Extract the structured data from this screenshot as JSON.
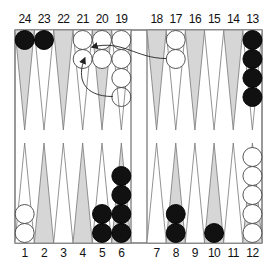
{
  "diagram": {
    "type": "backgammon-position",
    "colors": {
      "frame": "#555555",
      "shaded_point": "#d6d6d6",
      "light_point": "#ffffff",
      "black_checker": "#111111",
      "white_checker": "#ffffff",
      "arrow": "#222222"
    },
    "top_labels": [
      "24",
      "23",
      "22",
      "21",
      "20",
      "19",
      "18",
      "17",
      "16",
      "15",
      "14",
      "13"
    ],
    "bottom_labels": [
      "1",
      "2",
      "3",
      "4",
      "5",
      "6",
      "7",
      "8",
      "9",
      "10",
      "11",
      "12"
    ],
    "points": [
      {
        "point": 1,
        "color": "white",
        "count": 2
      },
      {
        "point": 5,
        "color": "black",
        "count": 2
      },
      {
        "point": 6,
        "color": "black",
        "count": 4
      },
      {
        "point": 8,
        "color": "black",
        "count": 2
      },
      {
        "point": 10,
        "color": "black",
        "count": 1
      },
      {
        "point": 12,
        "color": "white",
        "count": 5
      },
      {
        "point": 13,
        "color": "black",
        "count": 4
      },
      {
        "point": 17,
        "color": "white",
        "count": 2
      },
      {
        "point": 19,
        "color": "white",
        "count": 4
      },
      {
        "point": 20,
        "color": "white",
        "count": 2
      },
      {
        "point": 21,
        "color": "white",
        "count": 2
      },
      {
        "point": 23,
        "color": "black",
        "count": 1
      },
      {
        "point": 24,
        "color": "black",
        "count": 1
      }
    ],
    "moves": [
      {
        "from": 17,
        "to": 21
      },
      {
        "from": 19,
        "to": 21
      }
    ]
  }
}
